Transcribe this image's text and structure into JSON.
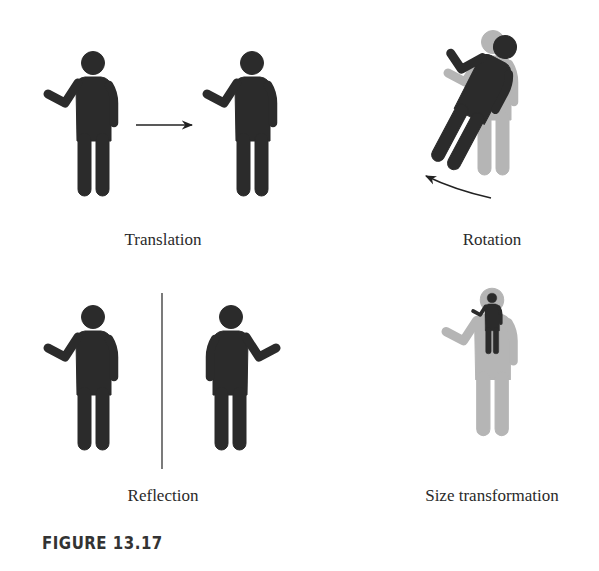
{
  "figure": {
    "caption": "FIGURE 13.17",
    "panels": [
      {
        "id": "translation",
        "label": "Translation"
      },
      {
        "id": "rotation",
        "label": "Rotation"
      },
      {
        "id": "reflection",
        "label": "Reflection"
      },
      {
        "id": "size",
        "label": "Size transformation"
      }
    ],
    "colors": {
      "figure_dark": "#2b2b2b",
      "figure_light": "#b5b5b5",
      "line": "#333333"
    },
    "icons": {
      "person": "standing-person-waving",
      "arrow": "right-arrow",
      "curved_arrow": "counterclockwise-arrow",
      "mirror_line": "vertical-line"
    }
  }
}
